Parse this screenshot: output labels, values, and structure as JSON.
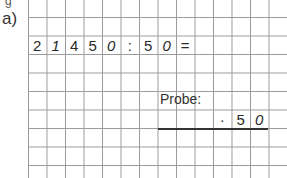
{
  "task": {
    "label": "a)",
    "top_fragment": "g",
    "equation": {
      "cells": [
        "2",
        "1",
        "4",
        "5",
        "0",
        ":",
        "5",
        "0",
        "="
      ],
      "row": 1
    },
    "probe": {
      "label": "Probe:",
      "cells": [
        "·",
        "5",
        "0"
      ]
    }
  },
  "grid": {
    "color": "#9a9a9a",
    "cell_size_px": 18.5,
    "columns": 14,
    "rows": 9
  }
}
